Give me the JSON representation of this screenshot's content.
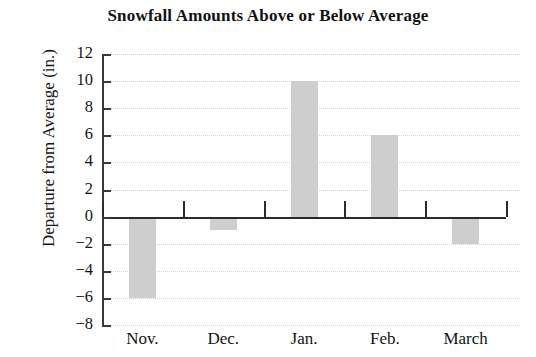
{
  "chart_data": {
    "type": "bar",
    "title": "Snowfall Amounts Above or Below Average",
    "xlabel": "",
    "ylabel": "Departure from Average (in.)",
    "categories": [
      "Nov.",
      "Dec.",
      "Jan.",
      "Feb.",
      "March"
    ],
    "values": [
      -6,
      -1,
      10,
      6,
      -2
    ],
    "series": [
      {
        "name": "Departure from Average",
        "values": [
          -6,
          -1,
          10,
          6,
          -2
        ]
      }
    ],
    "ylim": [
      -8,
      12
    ],
    "yticks": [
      12,
      10,
      8,
      6,
      4,
      2,
      0,
      -2,
      -4,
      -6,
      -8
    ],
    "ytick_labels": [
      "12",
      "10",
      "8",
      "6",
      "4",
      "2",
      "0",
      "−2",
      "−4",
      "−6",
      "−8"
    ],
    "grid": true,
    "grid_axis": "y",
    "legend": false,
    "legend_position": "none",
    "bar_color": "#cecece",
    "axis_color": "#2b2b2b",
    "grid_color": "#d3d3d3",
    "background_color": "#ffffff",
    "zero_line": 0,
    "units": "in."
  }
}
